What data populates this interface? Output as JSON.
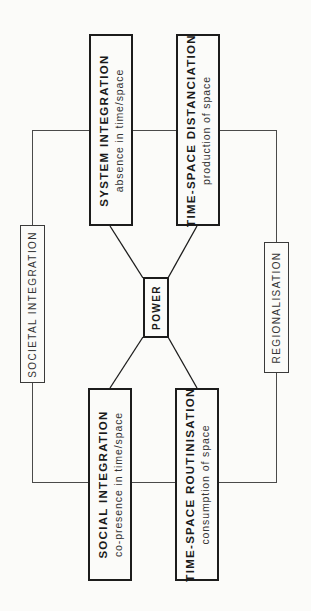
{
  "diagram": {
    "orientation": "rotated 90 degrees counter-clockwise",
    "center": {
      "label": "POWER"
    },
    "nodes": {
      "system_integration": {
        "title": "SYSTEM INTEGRATION",
        "subtitle": "absence in time/space"
      },
      "time_space_distanciation": {
        "title": "TIME-SPACE DISTANCIATION",
        "subtitle": "production of space"
      },
      "social_integration": {
        "title": "SOCIAL INTEGRATION",
        "subtitle": "co-presence in time/space"
      },
      "time_space_routinisation": {
        "title": "TIME-SPACE ROUTINISATION",
        "subtitle": "consumption of space"
      }
    },
    "side_labels": {
      "left": "SOCIETAL INTEGRATION",
      "right": "REGIONALISATION"
    },
    "edges": [
      [
        "POWER",
        "SYSTEM INTEGRATION"
      ],
      [
        "POWER",
        "TIME-SPACE DISTANCIATION"
      ],
      [
        "POWER",
        "SOCIAL INTEGRATION"
      ],
      [
        "POWER",
        "TIME-SPACE ROUTINISATION"
      ]
    ],
    "colors": {
      "line": "#1c1c1c",
      "frame": "#4a4a4a",
      "background": "#fbfbf9"
    }
  }
}
